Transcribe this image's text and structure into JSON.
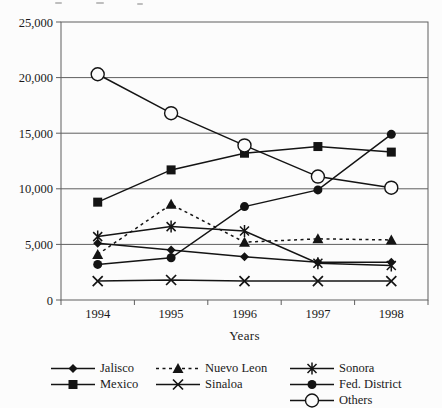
{
  "figure": {
    "xlabel": "Years",
    "background": "#fcfcfc",
    "ink_color": "#141414",
    "grid_color": "#5f5f5f"
  },
  "chart_data": {
    "type": "line",
    "title": "",
    "xlabel": "Years",
    "ylabel": "",
    "x": [
      "1994",
      "1995",
      "1996",
      "1997",
      "1998"
    ],
    "ylim": [
      0,
      25000
    ],
    "ytick_interval": 5000,
    "ytick_labels": [
      "0",
      "5,000",
      "10,000",
      "15,000",
      "20,000",
      "25,000"
    ],
    "grid": "horizontal",
    "legend_position": "bottom",
    "series": [
      {
        "name": "Jalisco",
        "marker": "diamond",
        "line": "solid",
        "values": [
          5100,
          4500,
          3900,
          3400,
          3400
        ]
      },
      {
        "name": "Mexico",
        "marker": "square",
        "line": "solid",
        "values": [
          8800,
          11700,
          13200,
          13800,
          13300
        ]
      },
      {
        "name": "Nuevo Leon",
        "marker": "triangle",
        "line": "dashed",
        "values": [
          4100,
          8600,
          5200,
          5500,
          5400
        ]
      },
      {
        "name": "Sinaloa",
        "marker": "x",
        "line": "solid",
        "values": [
          1700,
          1800,
          1700,
          1700,
          1700
        ]
      },
      {
        "name": "Sonora",
        "marker": "asterisk",
        "line": "solid",
        "values": [
          5700,
          6600,
          6200,
          3300,
          3100
        ]
      },
      {
        "name": "Fed. District",
        "marker": "dot",
        "line": "solid",
        "values": [
          3200,
          3800,
          8400,
          9900,
          14900
        ]
      },
      {
        "name": "Others",
        "marker": "circle",
        "line": "solid",
        "values": [
          20300,
          16800,
          13900,
          11100,
          10100
        ]
      }
    ],
    "legend_columns": [
      [
        "Jalisco",
        "Mexico"
      ],
      [
        "Nuevo Leon",
        "Sinaloa"
      ],
      [
        "Sonora",
        "Fed. District",
        "Others"
      ]
    ]
  }
}
